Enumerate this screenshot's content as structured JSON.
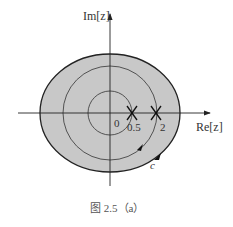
{
  "diagram": {
    "axes": {
      "x_label": "Re[z]",
      "y_label": "Im[z]"
    },
    "region": {
      "fill": "#c8c8c8",
      "stroke": "#222222"
    },
    "circles": [
      {
        "name": "inner",
        "radius_label": "0.5"
      },
      {
        "name": "middle",
        "radius_label": "2"
      }
    ],
    "points": [
      {
        "label": "0"
      },
      {
        "label": "0.5",
        "marker": "X"
      },
      {
        "label": "2",
        "marker": "X"
      }
    ],
    "contour_label": "c",
    "caption": "图 2.5（a）"
  }
}
